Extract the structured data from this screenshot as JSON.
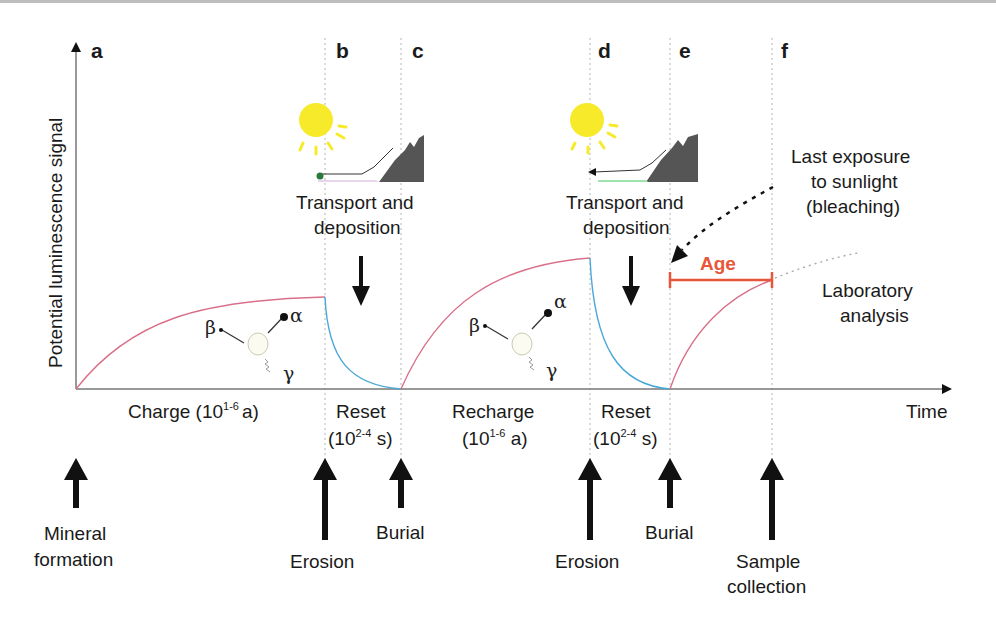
{
  "figure": {
    "y_axis_label": "Potential luminescence signal",
    "x_axis_label": "Time",
    "panels": [
      "a",
      "b",
      "c",
      "d",
      "e",
      "f"
    ],
    "phases": {
      "charge": {
        "text": "Charge (10",
        "sup": "1-6",
        "unit": "a)"
      },
      "reset1": {
        "line1": "Reset",
        "line2_pre": "(10",
        "sup": "2-4",
        "line2_post": " s)"
      },
      "recharge": {
        "line1": "Recharge",
        "line2_pre": "(10",
        "sup": "1-6",
        "line2_post": " a)"
      },
      "reset2": {
        "line1": "Reset",
        "line2_pre": "(10",
        "sup": "2-4",
        "line2_post": " s)"
      }
    },
    "scenes": [
      {
        "line1": "Transport and",
        "line2": "deposition"
      },
      {
        "line1": "Transport and",
        "line2": "deposition"
      }
    ],
    "bleaching_note": {
      "line1": "Last exposure",
      "line2": "to sunlight",
      "line3": "(bleaching)"
    },
    "lab_note": {
      "line1": "Laboratory",
      "line2": "analysis"
    },
    "age_label": "Age",
    "radiation": {
      "alpha": "α",
      "beta": "β",
      "gamma": "γ"
    },
    "events": [
      {
        "line1": "Mineral",
        "line2": "formation"
      },
      {
        "line1": "Erosion"
      },
      {
        "line1": "Burial"
      },
      {
        "line1": "Erosion"
      },
      {
        "line1": "Burial"
      },
      {
        "line1": "Sample",
        "line2": "collection"
      }
    ],
    "colors": {
      "charge_curve": "#d9708a",
      "reset_curve": "#4aa8d8",
      "age_bar": "#e8563a",
      "sun": "#f7ea2b",
      "mountain": "#555555",
      "axis": "#777777"
    }
  }
}
